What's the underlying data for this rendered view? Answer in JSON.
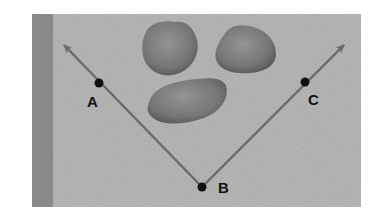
{
  "diagram": {
    "type": "angle",
    "colors": {
      "background": "#ffffff",
      "panel": "#b8b8b8",
      "strip": "#8f8f8f",
      "ray": "#6a6a6a",
      "point": "#111111",
      "stone": "#8a8a8a",
      "stone_dark": "#5e5e5e"
    },
    "vertex": {
      "label": "B",
      "x": 202,
      "y": 187
    },
    "points": [
      {
        "id": "A",
        "label": "A",
        "x": 99,
        "y": 83
      },
      {
        "id": "C",
        "label": "C",
        "x": 305,
        "y": 82
      },
      {
        "id": "B",
        "label": "B",
        "x": 202,
        "y": 187
      }
    ],
    "rays": [
      {
        "id": "ray-BA",
        "from": "B",
        "through": "A",
        "end_x": 62,
        "end_y": 43
      },
      {
        "id": "ray-BC",
        "from": "B",
        "through": "C",
        "end_x": 346,
        "end_y": 43
      }
    ],
    "stones": [
      {
        "id": "stone-1",
        "cx": 171,
        "cy": 51
      },
      {
        "id": "stone-2",
        "cx": 246,
        "cy": 51
      },
      {
        "id": "stone-3",
        "cx": 186,
        "cy": 103
      }
    ]
  },
  "labels": {
    "A": "A",
    "B": "B",
    "C": "C"
  }
}
